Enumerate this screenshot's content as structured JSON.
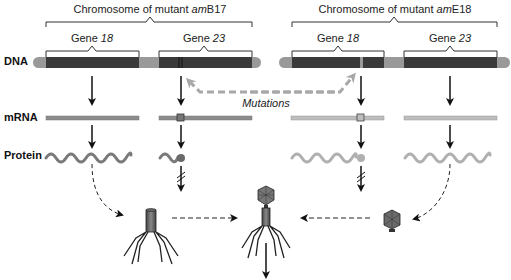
{
  "diagram": {
    "row_labels": {
      "dna": "DNA",
      "mrna": "mRNA",
      "protein": "Protein"
    },
    "mutant_left": {
      "title_prefix": "Chromosome of mutant ",
      "title_italic": "am",
      "title_suffix": "B17",
      "genes": [
        {
          "prefix": "Gene ",
          "number": "18"
        },
        {
          "prefix": "Gene ",
          "number": "23"
        }
      ]
    },
    "mutant_right": {
      "title_prefix": "Chromosome of mutant ",
      "title_italic": "am",
      "title_suffix": "E18",
      "genes": [
        {
          "prefix": "Gene ",
          "number": "18"
        },
        {
          "prefix": "Gene ",
          "number": "23"
        }
      ]
    },
    "mutations_label": "Mutations",
    "colors": {
      "dna_dark": "#3a3a3a",
      "dna_spacer": "#9a9a9a",
      "mrna_left": "#8c8c8c",
      "mrna_right": "#bdbdbd",
      "protein_left": "#7a7a7a",
      "protein_right": "#b0b0b0",
      "mutation_arrow": "#a8a8a8"
    }
  }
}
